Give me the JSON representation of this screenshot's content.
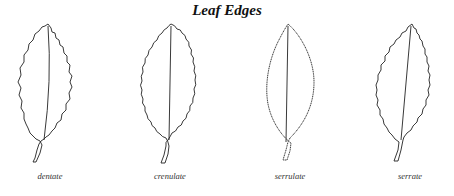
{
  "diagram": {
    "title": "Leaf Edges",
    "leaves": [
      {
        "label": "dentate",
        "cx": 50
      },
      {
        "label": "crenulate",
        "cx": 170
      },
      {
        "label": "serrulate",
        "cx": 290
      },
      {
        "label": "serrate",
        "cx": 410
      }
    ],
    "colors": {
      "stroke": "#222222",
      "background": "#ffffff"
    }
  }
}
